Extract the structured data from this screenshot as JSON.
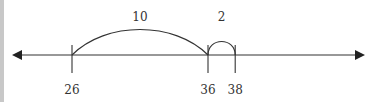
{
  "diagram": {
    "type": "number-line",
    "colors": {
      "line": "#333333",
      "text": "#333333",
      "border": "#c8c8c8"
    },
    "ticks": [
      {
        "value": 26,
        "label": "26"
      },
      {
        "value": 36,
        "label": "36"
      },
      {
        "value": 38,
        "label": "38"
      }
    ],
    "jumps": [
      {
        "from": 26,
        "to": 36,
        "label": "10"
      },
      {
        "from": 36,
        "to": 38,
        "label": "2"
      }
    ],
    "arrows": [
      "left",
      "right"
    ]
  }
}
